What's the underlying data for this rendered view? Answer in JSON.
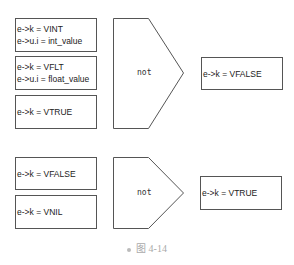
{
  "groups": [
    {
      "inputs": [
        {
          "lines": [
            "e->k = VINT",
            "e->u.i = int_value"
          ]
        },
        {
          "lines": [
            "e->k = VFLT",
            "e->u.i = float_value"
          ]
        },
        {
          "lines": [
            "e->k = VTRUE"
          ]
        }
      ],
      "operator": "not",
      "output": "e->k = VFALSE"
    },
    {
      "inputs": [
        {
          "lines": [
            "e->k = VFALSE"
          ]
        },
        {
          "lines": [
            "e->k = VNIL"
          ]
        }
      ],
      "operator": "not",
      "output": "e->k = VTRUE"
    }
  ],
  "caption": "图 4-14"
}
